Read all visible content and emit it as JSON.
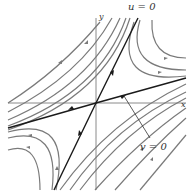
{
  "diagram": {
    "type": "phase-portrait-saddle",
    "labels": {
      "u_axis": "u = 0",
      "v_axis": "v = 0",
      "x_axis": "x",
      "y_axis": "y"
    },
    "colors": {
      "trajectory": "#7a7a7a",
      "separatrix": "#1a1a1a",
      "axis": "#8a8a8a"
    }
  }
}
